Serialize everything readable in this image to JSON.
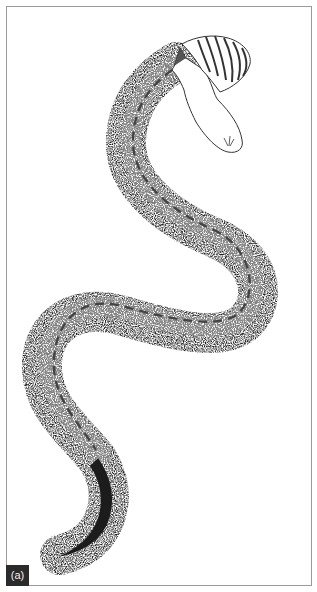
{
  "figure": {
    "panel_label": "(a)",
    "annotations": {
      "centerline": "dashed line along body",
      "head": "outlined head with scaled frill/cap"
    }
  },
  "colors": {
    "frame_border": "#9a9a9a",
    "badge_background": "#2b2b2b",
    "badge_text": "#f2f2f2",
    "ink": "#111111",
    "dash": "#444444"
  }
}
